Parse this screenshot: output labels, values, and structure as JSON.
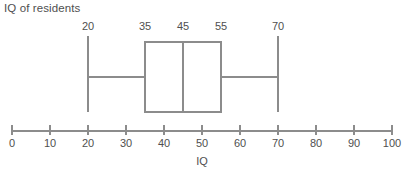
{
  "title": "IQ of residents",
  "axis_title": "IQ",
  "colors": {
    "line": "#8c8c8c",
    "text": "#4f4f4f",
    "background": "#ffffff"
  },
  "chart_data": {
    "type": "box",
    "title": "IQ of residents",
    "xlabel": "IQ",
    "ylabel": "",
    "orientation": "horizontal",
    "xlim": [
      0,
      100
    ],
    "grid": false,
    "legend": false,
    "x_ticks": [
      0,
      10,
      20,
      30,
      40,
      50,
      60,
      70,
      80,
      90,
      100
    ],
    "x_tick_labels": [
      "0",
      "10",
      "20",
      "30",
      "40",
      "50",
      "60",
      "70",
      "80",
      "90",
      "100"
    ],
    "box": {
      "min": 20,
      "q1": 35,
      "median": 45,
      "q3": 55,
      "max": 70
    },
    "annotation_labels": [
      {
        "value": 20,
        "text": "20"
      },
      {
        "value": 35,
        "text": "35"
      },
      {
        "value": 45,
        "text": "45"
      },
      {
        "value": 55,
        "text": "55"
      },
      {
        "value": 70,
        "text": "70"
      }
    ]
  }
}
